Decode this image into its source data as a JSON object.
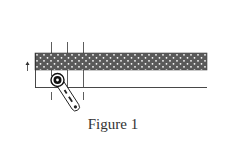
{
  "figure": {
    "caption": "Figure 1",
    "colors": {
      "band_fill": "#5a5a5a",
      "band_dots": "#ffffff",
      "line": "#333333",
      "background": "#ffffff"
    },
    "elements": {
      "band": {
        "label": "dotted fabric strip"
      },
      "guide_lines": {
        "count": 3
      },
      "arrow": {
        "direction": "up"
      },
      "tool": {
        "label": "rotary cutter"
      }
    }
  }
}
